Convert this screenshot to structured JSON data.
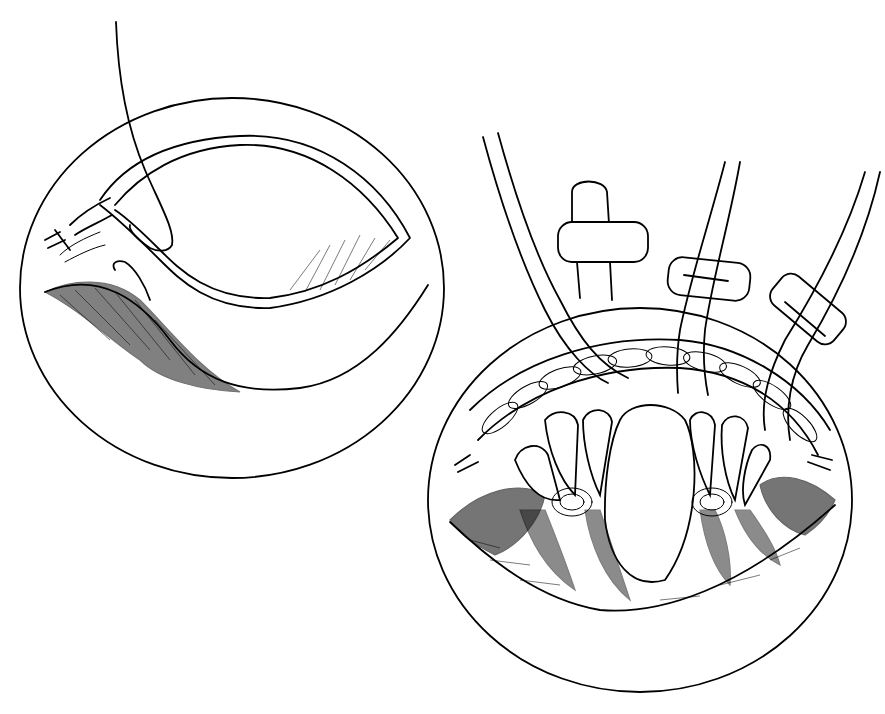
{
  "figure": {
    "type": "surgical-line-illustration",
    "colors": {
      "ink": "#000000",
      "background": "#ffffff"
    },
    "panels": [
      {
        "id": "left-panel",
        "description": "Circular operative field: single suture strand passing through wound edge, running suture knot at left",
        "elements": [
          "circle-field",
          "suture-strand",
          "incision-flap",
          "wound-bed",
          "knot"
        ]
      },
      {
        "id": "right-panel",
        "description": "Circular operative field: mattress sutures tied over bolsters/pledgets, braided running closure above",
        "elements": [
          "circle-field",
          "suture-pairs",
          "bolster-pads",
          "braided-closure",
          "wound-lobes",
          "tied-knots"
        ]
      }
    ]
  }
}
